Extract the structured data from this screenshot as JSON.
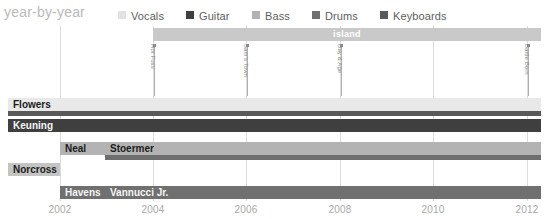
{
  "header": {
    "title": "year-by-year",
    "legend": [
      {
        "label": "Vocals",
        "color": "#e2e2e2",
        "x": 118
      },
      {
        "label": "Guitar",
        "color": "#3f3f3f",
        "x": 186
      },
      {
        "label": "Bass",
        "color": "#b3b3b3",
        "x": 252
      },
      {
        "label": "Drums",
        "color": "#707070",
        "x": 312
      },
      {
        "label": "Keyboards",
        "color": "#595959",
        "x": 380
      }
    ]
  },
  "chart_data": {
    "type": "bar",
    "title": "year-by-year",
    "xlabel": "",
    "ylabel": "",
    "xlim": [
      2002,
      2012
    ],
    "grid": true,
    "legend_position": "top",
    "x_ticks": [
      {
        "label": "2002",
        "value": 2002,
        "px": 60
      },
      {
        "label": "2004",
        "value": 2004,
        "px": 153
      },
      {
        "label": "2006",
        "value": 2006,
        "px": 246
      },
      {
        "label": "2008",
        "value": 2008,
        "px": 340
      },
      {
        "label": "2010",
        "value": 2010,
        "px": 433
      },
      {
        "label": "2012",
        "value": 2012,
        "px": 527
      }
    ],
    "label_eras": [
      {
        "name": "island",
        "start": 2004,
        "end": 2012,
        "px_start": 153,
        "px_end": 541,
        "color": "#c9c9c9"
      }
    ],
    "albums": [
      {
        "name": "Hot Fuss",
        "year": 2004,
        "px": 154
      },
      {
        "name": "Sam's Town",
        "year": 2006,
        "px": 247
      },
      {
        "name": "Day & Age",
        "year": 2008,
        "px": 341
      },
      {
        "name": "Battle Born",
        "year": 2012,
        "px": 528
      }
    ],
    "members": [
      {
        "name": "Flowers",
        "label_px_start": 8,
        "label_px_end": 60,
        "roles": [
          {
            "role": "Vocals",
            "color": "#e9e9e9",
            "px_start": 8,
            "px_end": 541,
            "start": 2001.2,
            "end": 2012
          },
          {
            "role": "Keyboards",
            "color": "#595959",
            "px_start": 8,
            "px_end": 541,
            "start": 2001.2,
            "end": 2012
          }
        ]
      },
      {
        "name": "Keuning",
        "label_px_start": 8,
        "label_px_end": 60,
        "roles": [
          {
            "role": "Guitar",
            "color": "#3f3f3f",
            "px_start": 8,
            "px_end": 541,
            "start": 2001.2,
            "end": 2012
          }
        ]
      },
      {
        "name": "Neal",
        "label_px_start": 60,
        "label_px_end": 105,
        "second_name": "Stoermer",
        "roles": [
          {
            "role": "Bass",
            "color": "#b3b3b3",
            "px_start": 60,
            "px_end": 541,
            "start": 2002,
            "end": 2012
          },
          {
            "role": "Guitar",
            "color": "#6e6e6e",
            "px_start": 105,
            "px_end": 541,
            "start": 2002.95,
            "end": 2012
          }
        ]
      },
      {
        "name": "Norcross",
        "label_px_start": 8,
        "label_px_end": 60,
        "roles": []
      },
      {
        "name": "Havens",
        "label_px_start": 60,
        "label_px_end": 105,
        "second_name": "Vannucci Jr.",
        "roles": [
          {
            "role": "Drums",
            "color": "#707070",
            "px_start": 60,
            "px_end": 541,
            "start": 2002,
            "end": 2012
          }
        ]
      }
    ],
    "rows": [
      {
        "name": "Flowers",
        "y": 72,
        "segments": [
          {
            "label": "Flowers",
            "px_start": 8,
            "px_end": 541,
            "color": "#e9e9e9",
            "text_color": "#1c1c1c"
          }
        ]
      },
      {
        "name": "Flowers-keys",
        "y": 85,
        "segments": [
          {
            "label": "",
            "px_start": 8,
            "px_end": 541,
            "color": "#595959",
            "text_color": "#ffffff"
          }
        ]
      },
      {
        "name": "Keuning",
        "y": 93,
        "segments": [
          {
            "label": "Keuning",
            "px_start": 8,
            "px_end": 541,
            "color": "#3f3f3f",
            "text_color": "#f5f5f5"
          }
        ]
      },
      {
        "name": "Neal",
        "y": 116,
        "segments": [
          {
            "label": "Neal",
            "px_start": 60,
            "px_end": 105,
            "color": "#b3b3b3",
            "text_color": "#1c1c1c"
          },
          {
            "label": "Stoermer",
            "px_start": 105,
            "px_end": 541,
            "color": "#b3b3b3",
            "text_color": "#1c1c1c"
          }
        ]
      },
      {
        "name": "Stoermer-guitar",
        "y": 129,
        "segments": [
          {
            "label": "",
            "px_start": 105,
            "px_end": 541,
            "color": "#6e6e6e",
            "text_color": "#ffffff"
          }
        ]
      },
      {
        "name": "Norcross",
        "y": 137,
        "segments": [
          {
            "label": "Norcross",
            "px_start": 8,
            "px_end": 60,
            "color": "#c4c4c4",
            "text_color": "#1c1c1c"
          }
        ]
      },
      {
        "name": "Havens",
        "y": 160,
        "segments": [
          {
            "label": "Havens",
            "px_start": 60,
            "px_end": 105,
            "color": "#707070",
            "text_color": "#f5f5f5"
          },
          {
            "label": "Vannucci Jr.",
            "px_start": 105,
            "px_end": 541,
            "color": "#707070",
            "text_color": "#f5f5f5"
          }
        ]
      }
    ]
  }
}
